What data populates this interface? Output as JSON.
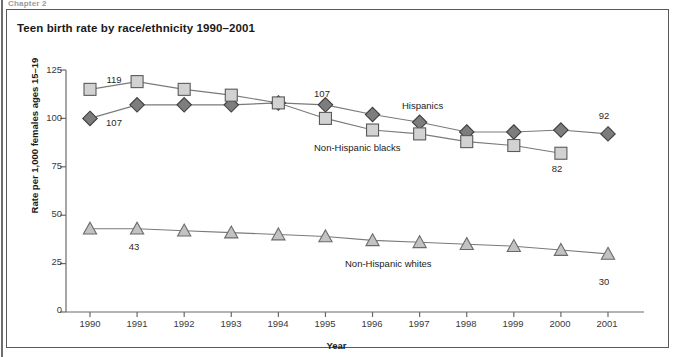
{
  "running_head": "Chapter 2",
  "figure": {
    "title": "Teen birth rate by race/ethnicity 1990–2001"
  },
  "chart_data": {
    "type": "line",
    "title": "Teen birth rate by race/ethnicity 1990–2001",
    "xlabel": "Year",
    "ylabel": "Rate per 1,000 females ages 15–19",
    "x": [
      1990,
      1991,
      1992,
      1993,
      1994,
      1995,
      1996,
      1997,
      1998,
      1999,
      2000,
      2001
    ],
    "categories": [
      "1990",
      "1991",
      "1992",
      "1993",
      "1994",
      "1995",
      "1996",
      "1997",
      "1998",
      "1999",
      "2000",
      "2001"
    ],
    "xlim": [
      1990,
      2001
    ],
    "ylim": [
      0,
      125
    ],
    "yticks": [
      0,
      25,
      50,
      75,
      100,
      125
    ],
    "ytick_labels": [
      "0",
      "25",
      "50",
      "75",
      "100",
      "125"
    ],
    "grid": false,
    "legend_position": "inline-annotations",
    "series": [
      {
        "name": "Hispanics",
        "marker": "diamond",
        "color": "#7d7d7d",
        "edge_color": "#3d3d3d",
        "values": [
          100,
          107,
          107,
          107,
          108,
          107,
          102,
          98,
          93,
          93,
          94,
          92
        ]
      },
      {
        "name": "Non-Hispanic blacks",
        "marker": "square",
        "color": "#d2d2d2",
        "edge_color": "#5a5a5a",
        "values": [
          115,
          119,
          115,
          112,
          108,
          100,
          94,
          92,
          88,
          86,
          82,
          null
        ]
      },
      {
        "name": "Non-Hispanic whites",
        "marker": "triangle",
        "color": "#c2c2c2",
        "edge_color": "#6a6a6a",
        "values": [
          43,
          43,
          42,
          41,
          40,
          39,
          37,
          36,
          35,
          34,
          32,
          30
        ]
      }
    ],
    "point_labels": [
      {
        "series": "Non-Hispanic blacks",
        "x": 1991,
        "value": "119",
        "position": "above"
      },
      {
        "series": "Hispanics",
        "x": 1991,
        "value": "107",
        "position": "below"
      },
      {
        "series": "Hispanics",
        "x": 1995,
        "value": "107",
        "position": "above"
      },
      {
        "series": "Non-Hispanic blacks",
        "x": 2000,
        "value": "82",
        "position": "below"
      },
      {
        "series": "Hispanics",
        "x": 2001,
        "value": "92",
        "position": "above"
      },
      {
        "series": "Non-Hispanic whites",
        "x": 1991,
        "value": "43",
        "position": "below"
      },
      {
        "series": "Non-Hispanic whites",
        "x": 2001,
        "value": "30",
        "position": "below"
      }
    ],
    "annotations": [
      {
        "text": "Hispanics",
        "series": "Hispanics"
      },
      {
        "text": "Non-Hispanic blacks",
        "series": "Non-Hispanic blacks"
      },
      {
        "text": "Non-Hispanic whites",
        "series": "Non-Hispanic whites"
      }
    ]
  },
  "axis": {
    "y_labels": [
      "125",
      "100",
      "75",
      "50",
      "25",
      "0"
    ],
    "x_labels": [
      "1990",
      "1991",
      "1992",
      "1993",
      "1994",
      "1995",
      "1996",
      "1997",
      "1998",
      "1999",
      "2000",
      "2001"
    ],
    "y_title": "Rate per 1,000 females ages 15–19",
    "x_title": "Year"
  },
  "labels": {
    "hispanics": "Hispanics",
    "nh_blacks": "Non-Hispanic blacks",
    "nh_whites": "Non-Hispanic whites",
    "p_119": "119",
    "p_107a": "107",
    "p_107b": "107",
    "p_82": "82",
    "p_92": "92",
    "p_43": "43",
    "p_30": "30"
  }
}
